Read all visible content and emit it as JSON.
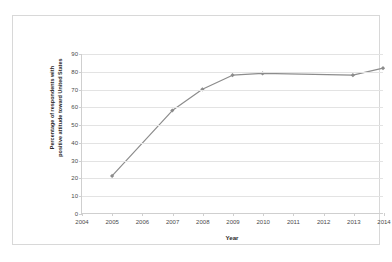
{
  "chart_data": {
    "type": "line",
    "title": "",
    "subtitle": "",
    "xlabel": "Year",
    "ylabel": "Percentage of respondents with\npositive attitude toward United States",
    "x": [
      2004,
      2005,
      2006,
      2007,
      2008,
      2009,
      2010,
      2011,
      2012,
      2013,
      2014
    ],
    "xtick_labels": [
      "2004",
      "2005",
      "2006",
      "2007",
      "2008",
      "2009",
      "2010",
      "2011",
      "2012",
      "2013",
      "2014"
    ],
    "ytick_labels": [
      "0",
      "10",
      "20",
      "30",
      "40",
      "50",
      "60",
      "70",
      "80",
      "90"
    ],
    "yticks": [
      0,
      10,
      20,
      30,
      40,
      50,
      60,
      70,
      80,
      90
    ],
    "xlim": [
      2004,
      2014
    ],
    "ylim": [
      0,
      90
    ],
    "grid": "horizontal",
    "legend": "none",
    "marker": "diamond",
    "series": [
      {
        "name": "Percentage of respondents with positive attitude toward United States",
        "color": "#8c8c8c",
        "points": [
          {
            "x": 2005,
            "y": 21
          },
          {
            "x": 2007,
            "y": 58
          },
          {
            "x": 2008,
            "y": 70
          },
          {
            "x": 2009,
            "y": 78
          },
          {
            "x": 2010,
            "y": 79
          },
          {
            "x": 2013,
            "y": 78
          },
          {
            "x": 2014,
            "y": 82
          }
        ]
      }
    ]
  },
  "style": {
    "line_color": "#8c8c8c",
    "marker_color": "#8c8c8c",
    "gridline_color": "#e3e3e3",
    "axis_color": "#cfcfcf",
    "frame_color": "#d8d8d8",
    "background": "#ffffff",
    "text_color": "#4a4a4a"
  }
}
